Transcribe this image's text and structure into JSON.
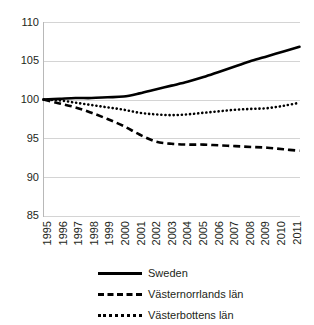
{
  "chart_data": {
    "type": "line",
    "title": "",
    "subtitle": "",
    "xlabel": "",
    "ylabel": "",
    "x": [
      1995,
      1996,
      1997,
      1998,
      1999,
      2000,
      2001,
      2002,
      2003,
      2004,
      2005,
      2006,
      2007,
      2008,
      2009,
      2010,
      2011
    ],
    "categories": [
      "1995",
      "1996",
      "1997",
      "1998",
      "1999",
      "2000",
      "2001",
      "2002",
      "2003",
      "2004",
      "2005",
      "2006",
      "2007",
      "2008",
      "2009",
      "2010",
      "2011"
    ],
    "series": [
      {
        "name": "Sweden",
        "style": "solid",
        "color": "#000000",
        "values": [
          100.0,
          100.1,
          100.2,
          100.2,
          100.3,
          100.4,
          100.8,
          101.3,
          101.8,
          102.3,
          102.9,
          103.6,
          104.3,
          105.0,
          105.6,
          106.2,
          106.8
        ]
      },
      {
        "name": "Västernorrlands län",
        "style": "dashed",
        "color": "#000000",
        "values": [
          100.0,
          99.5,
          99.0,
          98.3,
          97.5,
          96.6,
          95.5,
          94.6,
          94.3,
          94.2,
          94.2,
          94.1,
          94.0,
          93.9,
          93.8,
          93.6,
          93.4
        ]
      },
      {
        "name": "Västerbottens län",
        "style": "dotted",
        "color": "#000000",
        "values": [
          100.0,
          99.9,
          99.6,
          99.3,
          99.0,
          98.7,
          98.3,
          98.1,
          98.0,
          98.1,
          98.3,
          98.5,
          98.7,
          98.8,
          98.9,
          99.2,
          99.6
        ]
      }
    ],
    "ylim": [
      85,
      110
    ],
    "yticks": [
      110,
      105,
      100,
      95,
      90,
      85
    ],
    "ytick_labels": [
      "110",
      "105",
      "100",
      "95",
      "90",
      "85"
    ],
    "grid": true,
    "grid_axis": "y",
    "legend_position": "bottom",
    "legend": [
      "Sweden",
      "Västernorrlands län",
      "Västerbottens län"
    ]
  }
}
